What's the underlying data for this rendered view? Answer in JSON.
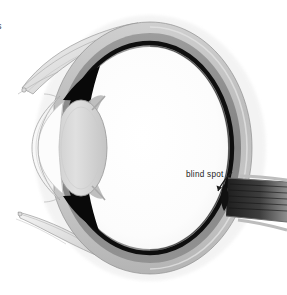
{
  "figure": {
    "annotations": [
      {
        "id": "blind-spot",
        "label": "blind spot",
        "x": 186,
        "y": 170
      },
      {
        "id": "clipped-edge-text",
        "label": "s",
        "x": -3,
        "y": 21
      }
    ],
    "structures": [
      {
        "name": "sclera",
        "tone": "#c9c9c9"
      },
      {
        "name": "choroid",
        "tone": "#8f8f8f"
      },
      {
        "name": "retina",
        "tone": "#141414"
      },
      {
        "name": "vitreous-body",
        "tone": "#fdfdfd"
      },
      {
        "name": "lens",
        "tone": "#d8d8d8"
      },
      {
        "name": "iris",
        "tone": "#0b0b0b"
      },
      {
        "name": "ciliary-body",
        "tone": "#bfbfbf"
      },
      {
        "name": "cornea",
        "tone": "#f2f2f2"
      },
      {
        "name": "anterior-chamber",
        "tone": "#fbfbfb"
      },
      {
        "name": "optic-nerve",
        "tone": "#3b3b3b"
      },
      {
        "name": "upper-eyelid",
        "tone": "#e6e6e6"
      },
      {
        "name": "lower-eyelid",
        "tone": "#e6e6e6"
      }
    ],
    "colors": {
      "background": "#ffffff",
      "ink": "#1c1c1c",
      "sclera_light": "#d5d5d5",
      "choroid_mid": "#8a8a8a",
      "retina_dark": "#101010",
      "nerve_dark": "#2f2f2f"
    }
  }
}
